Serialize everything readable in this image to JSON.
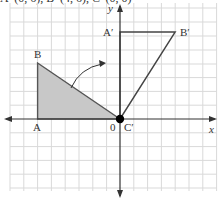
{
  "caption_cut": "A′ (0, 6), B′ (4, 6), C′ (0, 0)",
  "labels": {
    "y_axis": "y",
    "x_axis": "x",
    "A": "A",
    "B": "B",
    "origin": "0",
    "A_prime": "A′",
    "B_prime": "B′",
    "C_prime": "C′"
  },
  "geometry": {
    "grid_unit_px": 13.8,
    "origin_px": [
      120,
      119
    ],
    "original_triangle": {
      "A": [
        -6,
        0
      ],
      "B": [
        -6,
        4
      ],
      "C": [
        0,
        0
      ],
      "fill": "#c8c8c8"
    },
    "image_triangle": {
      "A_prime": [
        0,
        6
      ],
      "B_prime": [
        4,
        6
      ],
      "C_prime": [
        0,
        0
      ]
    },
    "transformation": "rotation 90° clockwise about origin"
  },
  "colors": {
    "grid": "#d9d9d9",
    "axis": "#333333",
    "shade": "#c8c8c8"
  }
}
